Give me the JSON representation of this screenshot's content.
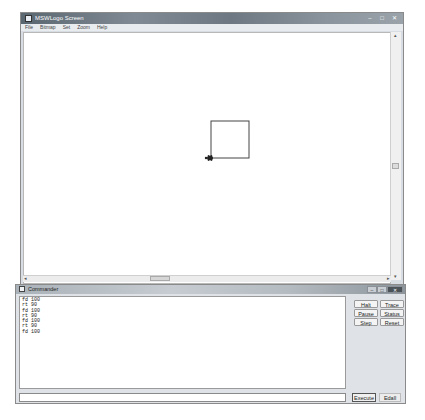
{
  "main_window": {
    "title": "MSWLogo Screen",
    "controls": {
      "minimize": "–",
      "maximize": "□",
      "close": "✕"
    },
    "menu": [
      "File",
      "Bitmap",
      "Set",
      "Zoom",
      "Help"
    ]
  },
  "canvas": {
    "drawing": {
      "shape": "square",
      "side_length": 100,
      "turtle_icon": "turtle-icon"
    },
    "scrollbars": {
      "left_arrow": "◂",
      "right_arrow": "▸",
      "up_arrow": "▴",
      "down_arrow": "▾"
    }
  },
  "commander": {
    "title": "Commander",
    "controls": {
      "minimize": "–",
      "maximize": "□",
      "close": "✕"
    },
    "history": [
      "fd 100",
      "rt 90",
      "fd 100",
      "rt 90",
      "fd 100",
      "rt 90",
      "fd 100"
    ],
    "buttons": [
      "Halt",
      "Trace",
      "Pause",
      "Status",
      "Step",
      "Reset"
    ],
    "input_value": "",
    "execute_label": "Execute",
    "edall_label": "Edall"
  }
}
